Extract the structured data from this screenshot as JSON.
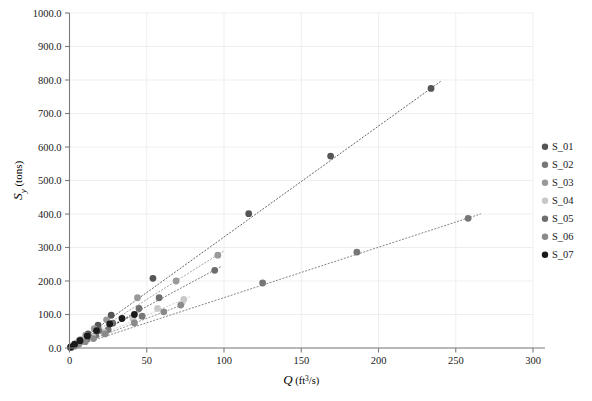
{
  "chart_data": {
    "type": "scatter",
    "title": "",
    "xlabel": "Q (ft3/s)",
    "xlabel_parts": {
      "symbol": "Q",
      "units_pre": " (ft",
      "units_sup": "3",
      "units_post": "/s)"
    },
    "ylabel": "Sy (tons)",
    "ylabel_parts": {
      "symbol": "S",
      "sub": "y",
      "units": " (tons)"
    },
    "xlim": [
      0,
      300
    ],
    "ylim": [
      0,
      1000
    ],
    "xticks": [
      0,
      50,
      100,
      150,
      200,
      250,
      300
    ],
    "xticklabels": [
      "0",
      "50",
      "100",
      "150",
      "200",
      "250",
      "300"
    ],
    "yticks": [
      0,
      100,
      200,
      300,
      400,
      500,
      600,
      700,
      800,
      900,
      1000
    ],
    "yticklabels": [
      "0.0",
      "100.0",
      "200.0",
      "300.0",
      "400.0",
      "500.0",
      "600.0",
      "700.0",
      "800.0",
      "900.0",
      "1000.0"
    ],
    "grid": true,
    "grid_axis": "both",
    "legend_position": "right",
    "trendline_style": "dotted",
    "marker": "circle",
    "series": [
      {
        "name": "S_01",
        "color": "#555555",
        "points": [
          {
            "x": 0.8,
            "y": 2
          },
          {
            "x": 3.5,
            "y": 12
          },
          {
            "x": 7.0,
            "y": 24
          },
          {
            "x": 12.0,
            "y": 42
          },
          {
            "x": 18.5,
            "y": 68
          },
          {
            "x": 27.0,
            "y": 98
          },
          {
            "x": 54.0,
            "y": 208
          },
          {
            "x": 116.0,
            "y": 401
          },
          {
            "x": 169.0,
            "y": 573
          },
          {
            "x": 234.0,
            "y": 775
          }
        ],
        "trend": {
          "x0": 0,
          "y0": 0,
          "x1": 240,
          "y1": 795
        }
      },
      {
        "name": "S_02",
        "color": "#777777",
        "points": [
          {
            "x": 0.8,
            "y": 1
          },
          {
            "x": 3.2,
            "y": 7
          },
          {
            "x": 6.5,
            "y": 16
          },
          {
            "x": 11.0,
            "y": 26
          },
          {
            "x": 17.0,
            "y": 38
          },
          {
            "x": 25.0,
            "y": 55
          },
          {
            "x": 47.0,
            "y": 95
          },
          {
            "x": 125.0,
            "y": 194
          },
          {
            "x": 186.0,
            "y": 286
          },
          {
            "x": 258.0,
            "y": 387
          }
        ],
        "trend": {
          "x0": 0,
          "y0": 0,
          "x1": 266,
          "y1": 400
        }
      },
      {
        "name": "S_03",
        "color": "#999999",
        "points": [
          {
            "x": 0.7,
            "y": 2
          },
          {
            "x": 3.0,
            "y": 10
          },
          {
            "x": 6.2,
            "y": 22
          },
          {
            "x": 10.5,
            "y": 38
          },
          {
            "x": 16.0,
            "y": 58
          },
          {
            "x": 24.0,
            "y": 84
          },
          {
            "x": 44.0,
            "y": 150
          },
          {
            "x": 69.0,
            "y": 200
          },
          {
            "x": 96.0,
            "y": 277
          }
        ],
        "trend": {
          "x0": 0,
          "y0": 0,
          "x1": 100,
          "y1": 290
        }
      },
      {
        "name": "S_04",
        "color": "#c8c8c8",
        "points": [
          {
            "x": 0.6,
            "y": 1
          },
          {
            "x": 2.8,
            "y": 6
          },
          {
            "x": 5.8,
            "y": 13
          },
          {
            "x": 9.8,
            "y": 22
          },
          {
            "x": 15.0,
            "y": 33
          },
          {
            "x": 22.0,
            "y": 48
          },
          {
            "x": 41.0,
            "y": 88
          },
          {
            "x": 57.0,
            "y": 118
          },
          {
            "x": 74.0,
            "y": 145
          }
        ],
        "trend": {
          "x0": 0,
          "y0": 0,
          "x1": 78,
          "y1": 153
        }
      },
      {
        "name": "S_05",
        "color": "#6e6e6e",
        "points": [
          {
            "x": 0.9,
            "y": 2
          },
          {
            "x": 3.4,
            "y": 9
          },
          {
            "x": 7.2,
            "y": 20
          },
          {
            "x": 12.5,
            "y": 34
          },
          {
            "x": 19.0,
            "y": 52
          },
          {
            "x": 28.0,
            "y": 74
          },
          {
            "x": 45.0,
            "y": 118
          },
          {
            "x": 58.0,
            "y": 150
          },
          {
            "x": 94.0,
            "y": 232
          }
        ],
        "trend": {
          "x0": 0,
          "y0": 0,
          "x1": 98,
          "y1": 243
        }
      },
      {
        "name": "S_06",
        "color": "#8a8a8a",
        "points": [
          {
            "x": 0.7,
            "y": 1
          },
          {
            "x": 3.0,
            "y": 5
          },
          {
            "x": 6.0,
            "y": 11
          },
          {
            "x": 10.2,
            "y": 19
          },
          {
            "x": 15.5,
            "y": 28
          },
          {
            "x": 23.0,
            "y": 42
          },
          {
            "x": 42.0,
            "y": 75
          },
          {
            "x": 61.0,
            "y": 108
          },
          {
            "x": 72.0,
            "y": 128
          }
        ],
        "trend": {
          "x0": 0,
          "y0": 0,
          "x1": 76,
          "y1": 134
        }
      },
      {
        "name": "S_07",
        "color": "#1a1a1a",
        "points": [
          {
            "x": 0.8,
            "y": 3
          },
          {
            "x": 3.3,
            "y": 11
          },
          {
            "x": 6.8,
            "y": 22
          },
          {
            "x": 11.5,
            "y": 36
          },
          {
            "x": 17.5,
            "y": 52
          },
          {
            "x": 26.0,
            "y": 72
          },
          {
            "x": 34.0,
            "y": 88
          },
          {
            "x": 42.0,
            "y": 100
          }
        ],
        "trend": {
          "x0": 0,
          "y0": 0,
          "x1": 46,
          "y1": 110
        }
      }
    ]
  },
  "legend": {
    "items": [
      {
        "label": "S_01",
        "color": "#555555"
      },
      {
        "label": "S_02",
        "color": "#777777"
      },
      {
        "label": "S_03",
        "color": "#999999"
      },
      {
        "label": "S_04",
        "color": "#c8c8c8"
      },
      {
        "label": "S_05",
        "color": "#6e6e6e"
      },
      {
        "label": "S_06",
        "color": "#8a8a8a"
      },
      {
        "label": "S_07",
        "color": "#1a1a1a"
      }
    ]
  }
}
